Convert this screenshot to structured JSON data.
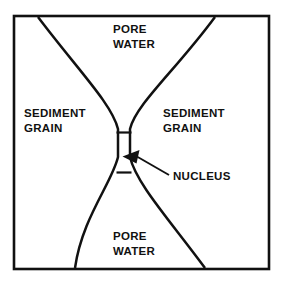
{
  "figure": {
    "background_color": "#ffffff",
    "ink_color": "#111111"
  },
  "frame": {
    "name": "diagram-border",
    "stroke_color": "#111111"
  },
  "labels": {
    "pore_water_top": {
      "line1": "PORE",
      "line2": "WATER"
    },
    "pore_water_bottom": {
      "line1": "PORE",
      "line2": "WATER"
    },
    "sediment_grain_left": {
      "line1": "SEDIMENT",
      "line2": "GRAIN"
    },
    "sediment_grain_right": {
      "line1": "SEDIMENT",
      "line2": "GRAIN"
    },
    "nucleus": {
      "text": "NUCLEUS"
    }
  },
  "annotations": {
    "nucleus_pointer": {
      "icon": "arrow-icon",
      "target": "nucleus-neck"
    }
  },
  "regions": [
    {
      "id": "pore-water-top",
      "label": "PORE WATER"
    },
    {
      "id": "sediment-grain-left",
      "label": "SEDIMENT GRAIN"
    },
    {
      "id": "sediment-grain-right",
      "label": "SEDIMENT GRAIN"
    },
    {
      "id": "pore-water-bottom",
      "label": "PORE WATER"
    },
    {
      "id": "nucleus",
      "label": "NUCLEUS"
    }
  ]
}
